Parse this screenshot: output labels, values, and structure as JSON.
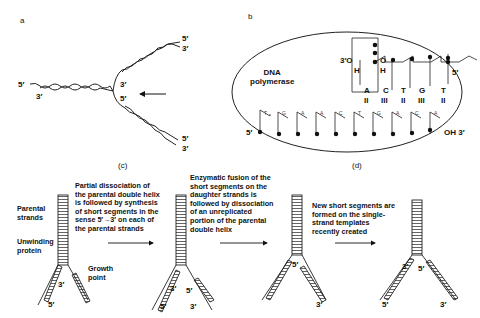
{
  "panels": {
    "a": {
      "letter": "a",
      "labels": {
        "left_5": "5′",
        "left_3": "3′",
        "fork_3": "3′",
        "fork_5": "5′",
        "top_5": "5′",
        "top_3": "3′",
        "bot_5": "5′",
        "bot_3": "3′"
      }
    },
    "b": {
      "letter": "b",
      "enzyme": "DNA\npolymerase",
      "primer": {
        "o3": "3′O",
        "h1": "H",
        "o2": "O",
        "h2": "H",
        "end5": "5′"
      },
      "new_bases": [
        {
          "base": "A",
          "bonds": "II"
        },
        {
          "base": "C",
          "bonds": "III"
        },
        {
          "base": "T",
          "bonds": "II"
        },
        {
          "base": "G",
          "bonds": "III"
        },
        {
          "base": "T",
          "bonds": "II"
        }
      ],
      "template_bases": [
        "T",
        "G",
        "A",
        "A",
        "C",
        "T",
        "G",
        "A",
        "C",
        "A"
      ],
      "template_5": "5′",
      "template_3": "OH 3′"
    },
    "c": {
      "letter": "(c)",
      "labels": {
        "parental": "Parental\nstrands",
        "unwinding": "Unwinding\nprotein",
        "growth": "Growth\npoint",
        "s3": "3′",
        "s5": "5′",
        "m3": "3′",
        "m5a": "5′",
        "m5b": "5′",
        "m3b": "3′"
      },
      "step1": "Partial dissociation of\nthe parental double helix\nis followed by synthesis\nof short segments in the\nsense 5′→3′ on each of\nthe parental strands"
    },
    "d": {
      "letter": "(d)",
      "step2": "Enzymatic fusion of the\nshort segments on the\ndaughter strands is\nfollowed by dissociation\nof an unreplicated\nportion of the parental\ndouble helix",
      "step3": "New short segments are\nformed on the single-\nstrand templates\nrecently created",
      "labels": {
        "f3_5": "5′",
        "f3_3": "3′",
        "f4_3": "3′",
        "f4_5a": "5′",
        "f4_3b": "3′",
        "f4_5b": "5′"
      }
    }
  }
}
